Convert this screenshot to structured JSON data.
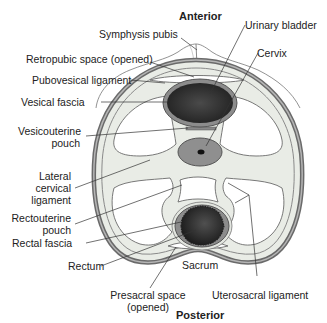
{
  "diagram": {
    "type": "anatomical-cross-section",
    "orientation": {
      "top": "Anterior",
      "bottom": "Posterior"
    },
    "labels": {
      "symphysis_pubis": "Symphysis pubis",
      "retropubic_space": "Retropubic space (opened)",
      "pubovesical_ligament": "Pubovesical ligament",
      "vesical_fascia": "Vesical fascia",
      "vesicouterine_pouch_line1": "Vesicouterine",
      "vesicouterine_pouch_line2": "pouch",
      "lateral_cervical_line1": "Lateral",
      "lateral_cervical_line2": "cervical",
      "lateral_cervical_line3": "ligament",
      "rectouterine_pouch_line1": "Rectouterine",
      "rectouterine_pouch_line2": "pouch",
      "rectal_fascia": "Rectal fascia",
      "rectum": "Rectum",
      "urinary_bladder": "Urinary bladder",
      "cervix": "Cervix",
      "sacrum": "Sacrum",
      "presacral_space_line1": "Presacral space",
      "presacral_space_line2": "(opened)",
      "uterosacral_ligament": "Uterosacral ligament"
    },
    "colors": {
      "outline": "#555555",
      "outer_ring": "#8a8a8a",
      "fascia_fill": "#e9ece6",
      "organ_dark": "#2e2e2e",
      "organ_wall": "#8c8c8c",
      "cervix_fill": "#8f8f8f",
      "leader_line": "#333333"
    }
  }
}
